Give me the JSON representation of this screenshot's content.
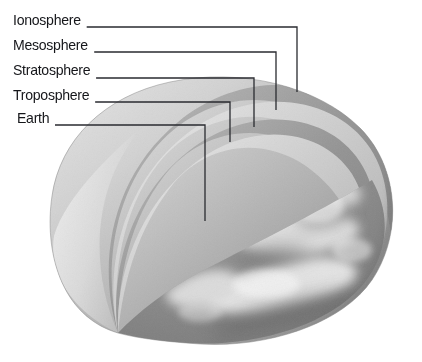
{
  "figure": {
    "style": "grayscale airbrush illustration",
    "background_color": "#ffffff",
    "line_color": "#2a2b30",
    "text_color": "#15161a"
  },
  "labels": [
    {
      "id": "ionosphere",
      "text": "Ionosphere",
      "x": 13,
      "y": 12,
      "leader_y": 27,
      "leader_x_end": 297,
      "drop_to_y": 92
    },
    {
      "id": "mesosphere",
      "text": "Mesosphere",
      "x": 13,
      "y": 37,
      "leader_y": 52,
      "leader_x_end": 276,
      "drop_to_y": 110
    },
    {
      "id": "stratosphere",
      "text": "Stratosphere",
      "x": 13,
      "y": 62,
      "leader_y": 78,
      "leader_x_end": 254,
      "drop_to_y": 127
    },
    {
      "id": "troposphere",
      "text": "Troposphere",
      "x": 13,
      "y": 87,
      "leader_y": 102,
      "leader_x_end": 230,
      "drop_to_y": 142
    },
    {
      "id": "earth",
      "text": "Earth",
      "x": 17,
      "y": 110,
      "leader_y": 125,
      "leader_x_end": 205,
      "drop_to_y": 221
    }
  ],
  "layer_bands": [
    {
      "name": "ionosphere-band",
      "tone": "#a0a0a0"
    },
    {
      "name": "mesosphere-band",
      "tone": "#c9c9c9"
    },
    {
      "name": "stratosphere-band",
      "tone": "#9b9b9b"
    },
    {
      "name": "troposphere-band",
      "tone": "#c4c4c4"
    },
    {
      "name": "earth-surface",
      "tone": "#8d8d8d"
    }
  ],
  "palette": {
    "dark_band": "#9a9a9a",
    "light_band": "#cdcdcd",
    "cut_face": "#dcdcdc",
    "earth_dark": "#7e7e7e",
    "earth_light": "#efefef"
  }
}
